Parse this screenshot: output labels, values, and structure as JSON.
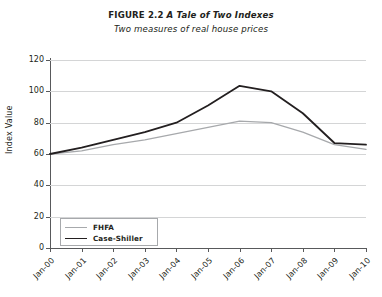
{
  "figure": {
    "label": "FIGURE 2.2",
    "title": "A Tale of Two Indexes",
    "subtitle": "Two measures of real house prices"
  },
  "legend": {
    "position": "bottom-left-inside",
    "entries": [
      {
        "name": "FHFA",
        "color": "#a7a9ac"
      },
      {
        "name": "Case-Shiller",
        "color": "#231f20"
      }
    ]
  },
  "chart_data": {
    "type": "line",
    "title": "FIGURE 2.2 A Tale of Two Indexes",
    "subtitle": "Two measures of real house prices",
    "xlabel": "",
    "ylabel": "Index Value",
    "categories": [
      "Jan-00",
      "Jan-01",
      "Jan-02",
      "Jan-03",
      "Jan-04",
      "Jan-05",
      "Jan-06",
      "Jan-07",
      "Jan-08",
      "Jan-09",
      "Jan-10"
    ],
    "series": [
      {
        "name": "FHFA",
        "color": "#a7a9ac",
        "values": [
          60,
          62,
          66,
          69,
          73,
          77,
          81,
          80,
          74,
          66,
          63
        ]
      },
      {
        "name": "Case-Shiller",
        "color": "#231f20",
        "values": [
          60,
          64,
          69,
          74,
          80,
          91,
          103.5,
          100,
          86,
          67,
          66
        ]
      }
    ],
    "ylim": [
      0,
      120
    ],
    "yticks": [
      0,
      20,
      40,
      60,
      80,
      100,
      120
    ],
    "ytick_labels": [
      "0",
      "20",
      "40",
      "60",
      "80",
      "100",
      "120"
    ],
    "grid": "horizontal",
    "grid_color": "#d4d5d6",
    "legend_position": "lower left"
  }
}
